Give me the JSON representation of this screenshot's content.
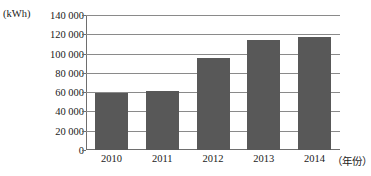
{
  "chart_data": {
    "type": "bar",
    "title": "",
    "xlabel": "（年份）",
    "ylabel": "(kWh)",
    "categories": [
      "2010",
      "2011",
      "2012",
      "2013",
      "2014"
    ],
    "values": [
      59500,
      61500,
      95000,
      114000,
      117000
    ],
    "ylim": [
      0,
      140000
    ],
    "ytick_step": 20000,
    "ytick_labels": [
      "140 000",
      "120 000",
      "100 000",
      "80 000",
      "60 000",
      "40 000",
      "20 000",
      "0"
    ],
    "ytick_values": [
      140000,
      120000,
      100000,
      80000,
      60000,
      40000,
      20000,
      0
    ],
    "grid": true,
    "legend": "none",
    "series": [
      {
        "name": "",
        "values": [
          59500,
          61500,
          95000,
          114000,
          117000
        ]
      }
    ],
    "colors": {
      "bar_fill": "#585858",
      "gridline": "#8a8a8a",
      "axis": "#6e6e6e",
      "background": "#ffffff",
      "text": "#1a1a1a"
    }
  }
}
